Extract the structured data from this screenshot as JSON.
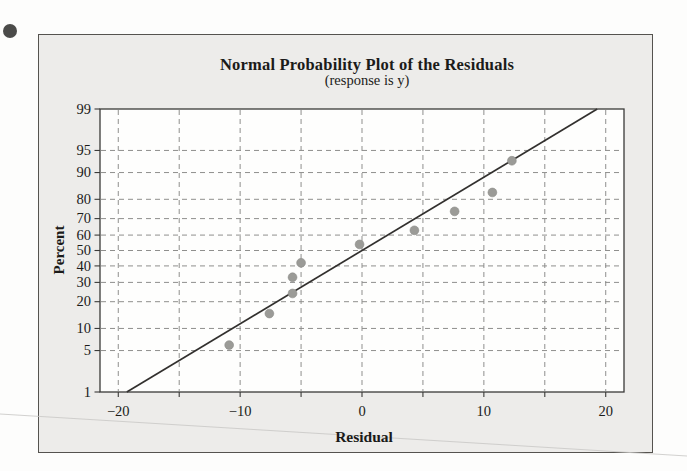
{
  "page": {
    "bullet_icon": "circle-bullet"
  },
  "colors": {
    "panel_bg": "#edecea",
    "plot_bg": "#fefefd",
    "axis": "#3a3a38",
    "grid": "#8f8f8d",
    "fit_line": "#32302e",
    "point": "#9b9b97",
    "point_edge": "#8c8c88",
    "text": "#1b1b19",
    "panel_border": "#55534f",
    "bullet": "#4b4b49",
    "artifact": "#cbcac8"
  },
  "chart_data": {
    "type": "scatter",
    "title": "Normal Probability Plot of the Residuals",
    "subtitle": "(response is y)",
    "xlabel": "Residual",
    "ylabel": "Percent",
    "grid": "dashed",
    "legend": "none",
    "x_axis": {
      "min": -21.5,
      "max": 21.5,
      "labeled_ticks": [
        -20,
        -10,
        0,
        10,
        20
      ],
      "minor_ticks": [
        -20,
        -15,
        -10,
        -5,
        0,
        5,
        10,
        15,
        20
      ]
    },
    "y_axis": {
      "scale": "normal-probability-percent",
      "min": 1,
      "max": 99,
      "ticks": [
        1,
        5,
        10,
        20,
        30,
        40,
        50,
        60,
        70,
        80,
        90,
        95,
        99
      ],
      "gridline_ticks": [
        5,
        10,
        20,
        30,
        40,
        50,
        60,
        70,
        80,
        90,
        95
      ]
    },
    "points": [
      {
        "residual": -10.9,
        "percent": 6
      },
      {
        "residual": -7.6,
        "percent": 15
      },
      {
        "residual": -5.7,
        "percent": 24
      },
      {
        "residual": -5.7,
        "percent": 33
      },
      {
        "residual": -5.0,
        "percent": 42
      },
      {
        "residual": -0.2,
        "percent": 54
      },
      {
        "residual": 4.3,
        "percent": 63
      },
      {
        "residual": 7.6,
        "percent": 74
      },
      {
        "residual": 10.7,
        "percent": 83
      },
      {
        "residual": 12.3,
        "percent": 93
      }
    ],
    "fit_line": {
      "from": {
        "residual": -19.3,
        "percent": 1
      },
      "to": {
        "residual": 19.3,
        "percent": 99
      }
    }
  }
}
